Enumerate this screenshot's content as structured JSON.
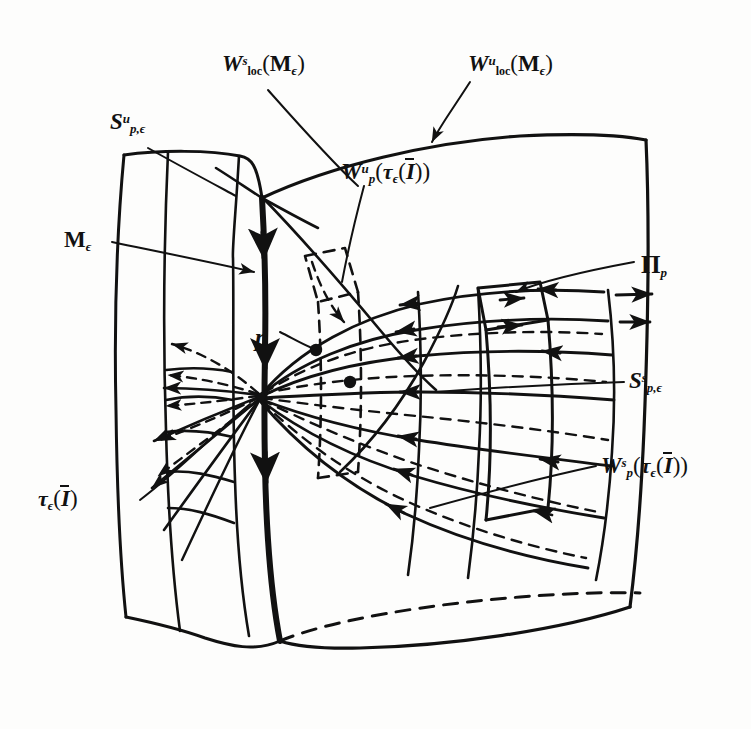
{
  "figure": {
    "domain": "mathematical-diagram",
    "width": 751,
    "height": 729,
    "ink_color": "#111111",
    "paper_color": "#fdfdfc"
  },
  "labels": [
    {
      "id": "w-loc-s",
      "name": "w-loc-stable-label",
      "text": "W^s_loc(M_e)",
      "parts": {
        "base": "W",
        "sup": "s",
        "sub": "loc",
        "open": "(",
        "cal": "M",
        "cal_sub": "ϵ",
        "close": ")"
      },
      "x": 222,
      "y": 52
    },
    {
      "id": "w-loc-u",
      "name": "w-loc-unstable-label",
      "text": "W^u_loc(M_e)",
      "parts": {
        "base": "W",
        "sup": "u",
        "sub": "loc",
        "open": "(",
        "cal": "M",
        "cal_sub": "ϵ",
        "close": ")"
      },
      "x": 468,
      "y": 52
    },
    {
      "id": "s-u-p-eps",
      "name": "s-unstable-p-eps-label",
      "text": "S^u_{p,e}",
      "parts": {
        "base": "S",
        "sup": "u",
        "sub": "p,ϵ"
      },
      "x": 110,
      "y": 110
    },
    {
      "id": "w-u-p",
      "name": "w-unstable-p-label",
      "text": "W^u_p(t_e(I-bar))",
      "parts": {
        "base": "W",
        "sup": "u",
        "sub": "p",
        "open": "(",
        "tau": "τ",
        "tau_sub": "ϵ",
        "open2": "(",
        "ibar": "I",
        "close2": ")",
        "close": ")"
      },
      "x": 341,
      "y": 160
    },
    {
      "id": "m-eps",
      "name": "m-epsilon-label",
      "text": "M_e",
      "parts": {
        "cal": "M",
        "cal_sub": "ϵ"
      },
      "x": 64,
      "y": 228
    },
    {
      "id": "pi-p",
      "name": "pi-p-label",
      "text": "Π_p",
      "parts": {
        "pi": "Π",
        "sub": "p"
      },
      "x": 641,
      "y": 252
    },
    {
      "id": "p-point",
      "name": "point-p-label",
      "text": "p",
      "parts": {
        "base": "p"
      },
      "x": 255,
      "y": 325
    },
    {
      "id": "s-s-p-eps",
      "name": "s-stable-p-eps-label",
      "text": "S^s_{p,e}",
      "parts": {
        "base": "S",
        "sup": "s",
        "sub": "p,ϵ"
      },
      "x": 629,
      "y": 369
    },
    {
      "id": "w-s-p",
      "name": "w-stable-p-label",
      "text": "W^s_p(t_e(I-bar))",
      "parts": {
        "base": "W",
        "sup": "s",
        "sub": "p",
        "open": "(",
        "tau": "τ",
        "tau_sub": "ϵ",
        "open2": "(",
        "ibar": "I",
        "close2": ")",
        "close": ")"
      },
      "x": 601,
      "y": 454
    },
    {
      "id": "tau-eps-I",
      "name": "tau-epsilon-I-label",
      "text": "t_e(I-bar)",
      "parts": {
        "tau": "τ",
        "tau_sub": "ϵ",
        "open": "(",
        "ibar": "I",
        "close": ")"
      },
      "x": 38,
      "y": 487
    }
  ],
  "glyphs": {
    "epsilon": "ϵ",
    "tau": "τ",
    "pi_upper": "Π",
    "script_m": "M"
  }
}
